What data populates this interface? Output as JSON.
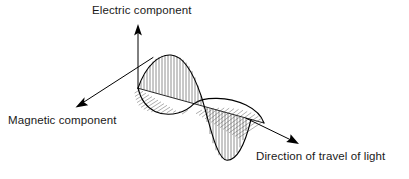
{
  "diagram": {
    "type": "electromagnetic-wave",
    "background_color": "#ffffff",
    "line_color": "#000000",
    "labels": {
      "electric": "Electric component",
      "magnetic": "Magnetic component",
      "direction": "Direction of travel of light"
    },
    "axes": [
      {
        "name": "electric-axis",
        "label": "Electric component",
        "orientation": "vertical-up",
        "origin": [
          138,
          88
        ],
        "tip": [
          138,
          25
        ],
        "arrow": true
      },
      {
        "name": "magnetic-axis",
        "label": "Magnetic component",
        "orientation": "down-left",
        "origin": [
          152,
          57
        ],
        "tip": [
          76,
          106
        ],
        "arrow": true
      },
      {
        "name": "direction-axis",
        "label": "Direction of travel of light",
        "orientation": "down-right",
        "origin": [
          138,
          88
        ],
        "tip": [
          298,
          144
        ],
        "arrow": true
      }
    ],
    "electric_wave": {
      "name": "electric-component-wave",
      "plane": "vertical",
      "hatching": "vertical-lines",
      "hatch_count": 30,
      "crest_x": 176,
      "crest_y": 55,
      "trough_x": 223,
      "trough_y": 160,
      "zero_start_x": 138,
      "zero_mid_x": 200,
      "zero_end_x": 248,
      "amplitude_px": 44,
      "cycles": 1
    },
    "magnetic_wave": {
      "name": "magnetic-component-wave",
      "plane": "horizontal-perspective",
      "hatching": "slanted-lines",
      "hatch_count": 26,
      "crest_label": "toward-viewer",
      "trough_label": "away-from-viewer",
      "amplitude_px": 26,
      "cycles": 1
    }
  }
}
